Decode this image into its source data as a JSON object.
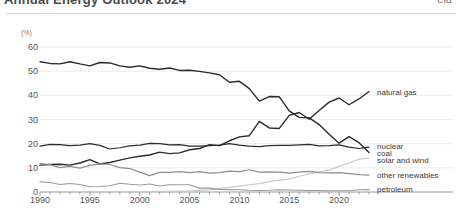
{
  "header": {
    "title": "Annual Energy Outlook 2024",
    "right_label": "eia",
    "clipped": true
  },
  "chart_data": {
    "type": "line",
    "title": "",
    "subtitle": "",
    "xlabel": "",
    "ylabel": "(%)",
    "yunit": "(%)",
    "xlim": [
      1990,
      2023
    ],
    "ylim": [
      0,
      60
    ],
    "yticks": [
      0,
      10,
      20,
      30,
      40,
      50,
      60
    ],
    "xticks": [
      1990,
      1995,
      2000,
      2005,
      2010,
      2015,
      2020
    ],
    "xticks_minor_step": 1,
    "grid": true,
    "legend_position": "right-inline",
    "x": [
      1990,
      1991,
      1992,
      1993,
      1994,
      1995,
      1996,
      1997,
      1998,
      1999,
      2000,
      2001,
      2002,
      2003,
      2004,
      2005,
      2006,
      2007,
      2008,
      2009,
      2010,
      2011,
      2012,
      2013,
      2014,
      2015,
      2016,
      2017,
      2018,
      2019,
      2020,
      2021,
      2022,
      2023
    ],
    "series": [
      {
        "name": "coal",
        "label": "coal",
        "color": "#2b2b2b",
        "width": 1.4,
        "label_y": 16.2,
        "values": [
          53.9,
          53.2,
          53.0,
          53.9,
          53.0,
          52.2,
          53.6,
          53.4,
          52.2,
          51.6,
          52.2,
          51.2,
          50.8,
          51.3,
          50.3,
          50.4,
          49.9,
          49.3,
          48.5,
          45.4,
          45.8,
          42.8,
          37.6,
          39.5,
          39.4,
          33.6,
          30.9,
          30.7,
          27.9,
          23.9,
          20.2,
          22.9,
          20.4,
          16.3
        ]
      },
      {
        "name": "natural gas",
        "label": "natural gas",
        "color": "#2b2b2b",
        "width": 1.4,
        "label_y": 41.5,
        "values": [
          11.1,
          11.4,
          11.5,
          11.1,
          12.0,
          13.4,
          11.6,
          12.2,
          13.2,
          14.1,
          14.8,
          15.3,
          16.5,
          15.9,
          16.2,
          17.5,
          18.0,
          19.6,
          19.2,
          21.2,
          22.8,
          23.3,
          29.2,
          26.5,
          26.3,
          31.7,
          32.9,
          30.1,
          33.7,
          37.2,
          38.9,
          36.1,
          38.5,
          41.6
        ]
      },
      {
        "name": "nuclear",
        "label": "nuclear",
        "color": "#2b2b2b",
        "width": 1.2,
        "label_y": 19.1,
        "values": [
          19.0,
          19.7,
          19.6,
          19.2,
          19.4,
          20.0,
          19.3,
          17.8,
          18.3,
          19.1,
          19.4,
          20.1,
          20.0,
          19.5,
          19.6,
          19.0,
          19.0,
          19.2,
          19.4,
          20.0,
          19.4,
          19.0,
          18.8,
          19.2,
          19.3,
          19.3,
          19.5,
          19.7,
          19.1,
          19.2,
          19.5,
          18.6,
          18.0,
          18.6
        ]
      },
      {
        "name": "solar and wind",
        "label": "solar and wind",
        "color": "#c9c9c9",
        "width": 1.2,
        "label_y": 13.3,
        "values": [
          0.1,
          0.1,
          0.1,
          0.1,
          0.1,
          0.1,
          0.1,
          0.1,
          0.1,
          0.1,
          0.2,
          0.2,
          0.3,
          0.3,
          0.4,
          0.4,
          0.7,
          0.9,
          1.4,
          1.9,
          2.4,
          3.0,
          3.5,
          4.3,
          4.9,
          5.3,
          6.5,
          7.5,
          8.3,
          9.1,
          10.6,
          12.0,
          13.6,
          14.0
        ]
      },
      {
        "name": "other renewables",
        "label": "other renewables",
        "color": "#8e8e8e",
        "width": 1.2,
        "label_y": 7.0,
        "values": [
          11.8,
          11.3,
          10.1,
          10.6,
          9.9,
          11.0,
          11.6,
          11.4,
          10.1,
          9.7,
          8.2,
          6.8,
          8.1,
          8.1,
          8.4,
          8.0,
          8.4,
          7.8,
          8.0,
          8.6,
          8.4,
          9.2,
          8.2,
          8.3,
          8.2,
          7.8,
          8.2,
          8.5,
          8.0,
          7.9,
          8.0,
          7.6,
          7.2,
          7.0
        ]
      },
      {
        "name": "petroleum",
        "label": "petroleum",
        "color": "#9a9a9a",
        "width": 1.1,
        "label_y": 1.2,
        "values": [
          4.2,
          3.9,
          3.1,
          3.5,
          3.1,
          2.2,
          2.3,
          2.6,
          3.6,
          3.2,
          2.9,
          3.3,
          2.5,
          3.0,
          3.0,
          3.0,
          1.6,
          1.6,
          1.1,
          1.0,
          0.9,
          0.7,
          0.6,
          0.7,
          0.9,
          0.8,
          0.7,
          0.6,
          0.6,
          0.5,
          0.5,
          0.5,
          0.9,
          1.0
        ]
      }
    ]
  }
}
